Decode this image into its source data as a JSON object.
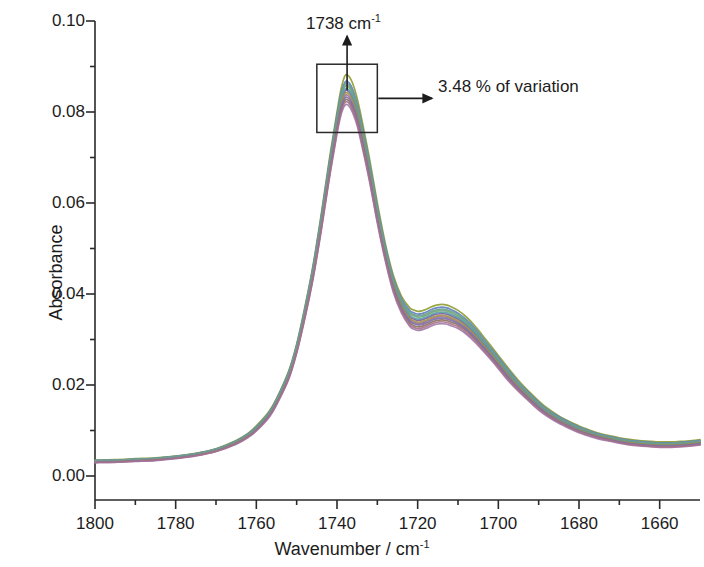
{
  "chart_data": {
    "type": "line",
    "title": "",
    "xlabel": "Wavenumber / cm",
    "xlabel_sup": "-1",
    "ylabel": "Absorbance",
    "xlim": [
      1800,
      1650
    ],
    "ylim": [
      0.0,
      0.1
    ],
    "x_reversed": true,
    "grid": false,
    "legend": false,
    "xticks": [
      1800,
      1780,
      1760,
      1740,
      1720,
      1700,
      1680,
      1660
    ],
    "xtick_labels": [
      "1800",
      "1780",
      "1760",
      "1740",
      "1720",
      "1700",
      "1680",
      "1660"
    ],
    "x_minor_tick_step": 10,
    "yticks": [
      0.0,
      0.02,
      0.04,
      0.06,
      0.08,
      0.1
    ],
    "ytick_labels": [
      "0.00",
      "0.02",
      "0.04",
      "0.06",
      "0.08",
      "0.10"
    ],
    "y_minor_tick_step": 0.01,
    "annotations": [
      {
        "name": "peak-position",
        "text": "1738 cm",
        "superscript": "-1",
        "arrow": "up",
        "points_to_x": 1738,
        "points_to_y": 0.0925
      },
      {
        "name": "variation-callout",
        "text": "3.48 % of variation",
        "arrow": "right",
        "points_to_x": 1735,
        "points_to_y": 0.0805
      }
    ],
    "highlight_box": {
      "name": "peak-variation-box",
      "x_range": [
        1745,
        1730
      ],
      "y_range": [
        0.0755,
        0.0905
      ]
    },
    "series_count": 12,
    "series_colors": [
      "#8f9b30",
      "#5a7fc0",
      "#7d5a9e",
      "#6fa86f",
      "#a06f9e",
      "#8b6f5a",
      "#5a9ba8",
      "#9e8f4a",
      "#7a6fa8",
      "#6f9b8f",
      "#a8708a",
      "#6b7f9e"
    ],
    "x": [
      1800,
      1795,
      1790,
      1785,
      1780,
      1775,
      1770,
      1765,
      1762,
      1760,
      1757,
      1755,
      1752,
      1750,
      1748,
      1746,
      1744,
      1742,
      1740,
      1739,
      1738,
      1737,
      1736,
      1735,
      1734,
      1732,
      1730,
      1728,
      1726,
      1724,
      1722,
      1721,
      1720,
      1719,
      1718,
      1717,
      1716,
      1715,
      1714,
      1713,
      1712,
      1710,
      1708,
      1706,
      1704,
      1702,
      1700,
      1698,
      1695,
      1692,
      1690,
      1688,
      1685,
      1682,
      1680,
      1678,
      1675,
      1672,
      1670,
      1668,
      1665,
      1662,
      1660,
      1657,
      1655,
      1652,
      1650
    ],
    "series": [
      {
        "name": "spectrum-max",
        "color": "#8f9b30",
        "values": [
          0.0035,
          0.0036,
          0.0038,
          0.004,
          0.0044,
          0.005,
          0.006,
          0.0078,
          0.0094,
          0.011,
          0.014,
          0.017,
          0.023,
          0.029,
          0.037,
          0.046,
          0.057,
          0.069,
          0.08,
          0.085,
          0.088,
          0.0878,
          0.086,
          0.083,
          0.079,
          0.07,
          0.06,
          0.051,
          0.044,
          0.0395,
          0.037,
          0.0365,
          0.0362,
          0.0363,
          0.0366,
          0.037,
          0.0374,
          0.0376,
          0.0377,
          0.0376,
          0.0373,
          0.0364,
          0.035,
          0.0332,
          0.031,
          0.0288,
          0.0265,
          0.0242,
          0.021,
          0.0182,
          0.0165,
          0.015,
          0.0132,
          0.0118,
          0.011,
          0.0103,
          0.0094,
          0.0088,
          0.0084,
          0.0081,
          0.0078,
          0.0076,
          0.0075,
          0.0075,
          0.0076,
          0.0078,
          0.008
        ]
      },
      {
        "name": "spectrum-upper",
        "color": "#5a7fc0",
        "values": [
          0.0034,
          0.0035,
          0.0037,
          0.0039,
          0.0043,
          0.0049,
          0.0059,
          0.0077,
          0.0093,
          0.0108,
          0.0138,
          0.0168,
          0.0228,
          0.0287,
          0.0366,
          0.0456,
          0.0565,
          0.0684,
          0.0793,
          0.084,
          0.0866,
          0.0864,
          0.0847,
          0.0818,
          0.0779,
          0.0691,
          0.0592,
          0.0504,
          0.0434,
          0.0389,
          0.0364,
          0.0359,
          0.0356,
          0.0357,
          0.036,
          0.0364,
          0.0368,
          0.037,
          0.0371,
          0.037,
          0.0367,
          0.0358,
          0.0344,
          0.0327,
          0.0305,
          0.0283,
          0.0261,
          0.0238,
          0.0206,
          0.0179,
          0.0162,
          0.0147,
          0.013,
          0.0116,
          0.0108,
          0.0101,
          0.0092,
          0.0086,
          0.0082,
          0.0079,
          0.0076,
          0.0074,
          0.0073,
          0.0073,
          0.0074,
          0.0076,
          0.0078
        ]
      },
      {
        "name": "spectrum-mid-upper",
        "color": "#6fa86f",
        "values": [
          0.0033,
          0.0034,
          0.0036,
          0.0038,
          0.0042,
          0.0048,
          0.0058,
          0.0076,
          0.0091,
          0.0106,
          0.0136,
          0.0166,
          0.0225,
          0.0284,
          0.0362,
          0.0451,
          0.0559,
          0.0677,
          0.0785,
          0.0831,
          0.0856,
          0.0854,
          0.0837,
          0.0809,
          0.077,
          0.0683,
          0.0585,
          0.0498,
          0.0428,
          0.0383,
          0.0357,
          0.0352,
          0.0349,
          0.035,
          0.0353,
          0.0357,
          0.0361,
          0.0363,
          0.0364,
          0.0363,
          0.036,
          0.0351,
          0.0338,
          0.0321,
          0.0299,
          0.0278,
          0.0256,
          0.0233,
          0.0202,
          0.0175,
          0.0158,
          0.0144,
          0.0127,
          0.0113,
          0.0105,
          0.0098,
          0.009,
          0.0084,
          0.008,
          0.0077,
          0.0074,
          0.0072,
          0.0071,
          0.0071,
          0.0072,
          0.0074,
          0.0076
        ]
      },
      {
        "name": "spectrum-mid",
        "color": "#7d5a9e",
        "values": [
          0.0032,
          0.0033,
          0.0035,
          0.0037,
          0.0041,
          0.0047,
          0.0057,
          0.0075,
          0.009,
          0.0105,
          0.0134,
          0.0164,
          0.0222,
          0.0281,
          0.0358,
          0.0446,
          0.0553,
          0.067,
          0.0777,
          0.0822,
          0.0846,
          0.0844,
          0.0827,
          0.0799,
          0.0761,
          0.0675,
          0.0578,
          0.0491,
          0.0422,
          0.0377,
          0.035,
          0.0345,
          0.0342,
          0.0343,
          0.0346,
          0.035,
          0.0354,
          0.0356,
          0.0357,
          0.0356,
          0.0353,
          0.0345,
          0.0332,
          0.0315,
          0.0294,
          0.0273,
          0.0251,
          0.0229,
          0.0198,
          0.0172,
          0.0155,
          0.0141,
          0.0124,
          0.0111,
          0.0103,
          0.0096,
          0.0088,
          0.0082,
          0.0078,
          0.0075,
          0.0072,
          0.007,
          0.0069,
          0.0069,
          0.007,
          0.0072,
          0.0074
        ]
      },
      {
        "name": "spectrum-mid-lower",
        "color": "#a06f9e",
        "values": [
          0.0031,
          0.0032,
          0.0034,
          0.0036,
          0.004,
          0.0046,
          0.0056,
          0.0073,
          0.0088,
          0.0103,
          0.0132,
          0.0161,
          0.0219,
          0.0277,
          0.0354,
          0.0441,
          0.0547,
          0.0663,
          0.0769,
          0.0813,
          0.0836,
          0.0834,
          0.0817,
          0.079,
          0.0752,
          0.0667,
          0.0571,
          0.0485,
          0.0416,
          0.0371,
          0.0344,
          0.0338,
          0.0335,
          0.0336,
          0.0339,
          0.0343,
          0.0347,
          0.0349,
          0.035,
          0.0349,
          0.0346,
          0.0338,
          0.0326,
          0.0309,
          0.0289,
          0.0268,
          0.0246,
          0.0224,
          0.0194,
          0.0168,
          0.0152,
          0.0138,
          0.0121,
          0.0108,
          0.01,
          0.0094,
          0.0086,
          0.008,
          0.0076,
          0.0073,
          0.007,
          0.0068,
          0.0067,
          0.0067,
          0.0068,
          0.007,
          0.0072
        ]
      },
      {
        "name": "spectrum-lower",
        "color": "#8b6f5a",
        "values": [
          0.003,
          0.0031,
          0.0033,
          0.0035,
          0.0039,
          0.0045,
          0.0055,
          0.0072,
          0.0087,
          0.0101,
          0.013,
          0.0159,
          0.0216,
          0.0274,
          0.035,
          0.0436,
          0.0541,
          0.0656,
          0.0761,
          0.0804,
          0.0826,
          0.0824,
          0.0807,
          0.078,
          0.0743,
          0.0659,
          0.0564,
          0.0479,
          0.041,
          0.0365,
          0.0337,
          0.0331,
          0.0328,
          0.0329,
          0.0332,
          0.0336,
          0.034,
          0.0342,
          0.0343,
          0.0342,
          0.0339,
          0.0332,
          0.032,
          0.0303,
          0.0283,
          0.0263,
          0.0241,
          0.0219,
          0.019,
          0.0165,
          0.0149,
          0.0135,
          0.0119,
          0.0106,
          0.0098,
          0.0092,
          0.0084,
          0.0078,
          0.0074,
          0.0071,
          0.0068,
          0.0066,
          0.0065,
          0.0065,
          0.0066,
          0.0068,
          0.007
        ]
      },
      {
        "name": "spectrum-min",
        "color": "#9e7aa8",
        "values": [
          0.0029,
          0.003,
          0.0032,
          0.0034,
          0.0038,
          0.0044,
          0.0054,
          0.007,
          0.0085,
          0.0099,
          0.0127,
          0.0156,
          0.0212,
          0.027,
          0.0345,
          0.043,
          0.0534,
          0.0648,
          0.0752,
          0.0794,
          0.0815,
          0.0813,
          0.0796,
          0.077,
          0.0733,
          0.065,
          0.0556,
          0.0472,
          0.0403,
          0.0358,
          0.0329,
          0.0323,
          0.032,
          0.0321,
          0.0324,
          0.0328,
          0.0332,
          0.0334,
          0.0335,
          0.0334,
          0.0331,
          0.0324,
          0.0312,
          0.0296,
          0.0277,
          0.0257,
          0.0236,
          0.0214,
          0.0186,
          0.0161,
          0.0145,
          0.0132,
          0.0116,
          0.0103,
          0.0095,
          0.0089,
          0.0081,
          0.0076,
          0.0072,
          0.0069,
          0.0066,
          0.0064,
          0.0063,
          0.0063,
          0.0064,
          0.0066,
          0.0068
        ]
      },
      {
        "name": "spectrum-extra-a",
        "color": "#5a9ba8",
        "values": [
          0.0033,
          0.0034,
          0.0036,
          0.0038,
          0.0042,
          0.0048,
          0.0058,
          0.0075,
          0.009,
          0.0105,
          0.0135,
          0.0165,
          0.0223,
          0.0282,
          0.036,
          0.0448,
          0.0556,
          0.0673,
          0.0781,
          0.0826,
          0.085,
          0.0848,
          0.0831,
          0.0803,
          0.0765,
          0.0679,
          0.0581,
          0.0494,
          0.0425,
          0.038,
          0.0353,
          0.0348,
          0.0345,
          0.0346,
          0.0349,
          0.0353,
          0.0357,
          0.0359,
          0.036,
          0.0359,
          0.0356,
          0.0348,
          0.0335,
          0.0318,
          0.0297,
          0.0276,
          0.0254,
          0.0231,
          0.02,
          0.0174,
          0.0157,
          0.0143,
          0.0126,
          0.0112,
          0.0104,
          0.0097,
          0.0089,
          0.0083,
          0.0079,
          0.0076,
          0.0073,
          0.0071,
          0.007,
          0.007,
          0.0071,
          0.0073,
          0.0075
        ]
      },
      {
        "name": "spectrum-extra-b",
        "color": "#9e8f4a",
        "values": [
          0.0032,
          0.0033,
          0.0035,
          0.0037,
          0.0041,
          0.0047,
          0.0056,
          0.0074,
          0.0089,
          0.0104,
          0.0133,
          0.0162,
          0.022,
          0.0279,
          0.0356,
          0.0443,
          0.055,
          0.0666,
          0.0773,
          0.0818,
          0.0841,
          0.0839,
          0.0822,
          0.0794,
          0.0757,
          0.0671,
          0.0574,
          0.0488,
          0.0419,
          0.0374,
          0.0347,
          0.0341,
          0.0338,
          0.0339,
          0.0342,
          0.0346,
          0.035,
          0.0352,
          0.0353,
          0.0352,
          0.0349,
          0.0341,
          0.0329,
          0.0312,
          0.0291,
          0.0271,
          0.0249,
          0.0226,
          0.0196,
          0.017,
          0.0153,
          0.0139,
          0.0122,
          0.0109,
          0.0101,
          0.0095,
          0.0087,
          0.0081,
          0.0077,
          0.0074,
          0.0071,
          0.0069,
          0.0068,
          0.0068,
          0.0069,
          0.0071,
          0.0073
        ]
      },
      {
        "name": "spectrum-extra-c",
        "color": "#7a6fa8",
        "values": [
          0.0031,
          0.0032,
          0.0034,
          0.0036,
          0.004,
          0.0046,
          0.0055,
          0.0072,
          0.0087,
          0.0102,
          0.0131,
          0.016,
          0.0217,
          0.0276,
          0.0352,
          0.0438,
          0.0544,
          0.0659,
          0.0765,
          0.0809,
          0.0831,
          0.0829,
          0.0812,
          0.0785,
          0.0748,
          0.0663,
          0.0567,
          0.0482,
          0.0413,
          0.0368,
          0.0341,
          0.0335,
          0.0332,
          0.0333,
          0.0336,
          0.034,
          0.0344,
          0.0346,
          0.0347,
          0.0346,
          0.0343,
          0.0335,
          0.0323,
          0.0306,
          0.0286,
          0.0266,
          0.0244,
          0.0222,
          0.0192,
          0.0167,
          0.0151,
          0.0137,
          0.012,
          0.0107,
          0.0099,
          0.0093,
          0.0085,
          0.0079,
          0.0075,
          0.0072,
          0.0069,
          0.0067,
          0.0066,
          0.0066,
          0.0067,
          0.0069,
          0.0071
        ]
      },
      {
        "name": "spectrum-extra-d",
        "color": "#6f9b8f",
        "values": [
          0.0034,
          0.0035,
          0.0037,
          0.0039,
          0.0043,
          0.0049,
          0.0059,
          0.0077,
          0.0092,
          0.0107,
          0.0137,
          0.0167,
          0.0226,
          0.0285,
          0.0364,
          0.0453,
          0.0562,
          0.068,
          0.0789,
          0.0835,
          0.0861,
          0.0859,
          0.0842,
          0.0813,
          0.0774,
          0.0687,
          0.0588,
          0.0501,
          0.0431,
          0.0386,
          0.036,
          0.0355,
          0.0352,
          0.0353,
          0.0356,
          0.036,
          0.0364,
          0.0366,
          0.0367,
          0.0366,
          0.0363,
          0.0355,
          0.0341,
          0.0324,
          0.0302,
          0.0281,
          0.0258,
          0.0236,
          0.0204,
          0.0177,
          0.016,
          0.0146,
          0.0128,
          0.0115,
          0.0107,
          0.01,
          0.0091,
          0.0085,
          0.0081,
          0.0078,
          0.0075,
          0.0073,
          0.0072,
          0.0072,
          0.0073,
          0.0075,
          0.0077
        ]
      },
      {
        "name": "spectrum-extra-e",
        "color": "#a8708a",
        "values": [
          0.003,
          0.0031,
          0.0033,
          0.0035,
          0.0039,
          0.0045,
          0.0054,
          0.0071,
          0.0086,
          0.01,
          0.0129,
          0.0158,
          0.0214,
          0.0272,
          0.0347,
          0.0433,
          0.0537,
          0.0652,
          0.0757,
          0.0799,
          0.0821,
          0.0819,
          0.0802,
          0.0775,
          0.0738,
          0.0655,
          0.056,
          0.0476,
          0.0407,
          0.0362,
          0.0333,
          0.0327,
          0.0324,
          0.0325,
          0.0328,
          0.0332,
          0.0336,
          0.0338,
          0.0339,
          0.0338,
          0.0335,
          0.0328,
          0.0316,
          0.03,
          0.028,
          0.026,
          0.0239,
          0.0217,
          0.0188,
          0.0163,
          0.0147,
          0.0134,
          0.0118,
          0.0105,
          0.0097,
          0.0091,
          0.0083,
          0.0077,
          0.0073,
          0.007,
          0.0067,
          0.0065,
          0.0064,
          0.0064,
          0.0065,
          0.0067,
          0.0069
        ]
      }
    ]
  }
}
